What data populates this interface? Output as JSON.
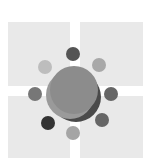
{
  "graphic": {
    "background": "#ffffff",
    "tile_color": "#e9e9e9",
    "tiles": [
      {
        "name": "top-left",
        "x": 8,
        "y": 22,
        "w": 62,
        "h": 64
      },
      {
        "name": "top-right",
        "x": 80,
        "y": 22,
        "w": 63,
        "h": 64
      },
      {
        "name": "bottom-left",
        "x": 8,
        "y": 96,
        "w": 62,
        "h": 62
      },
      {
        "name": "bottom-right",
        "x": 80,
        "y": 96,
        "w": 63,
        "h": 62
      }
    ],
    "center_shapes": [
      {
        "cx": 76,
        "cy": 97,
        "r": 25,
        "color": "#4a4a4a"
      },
      {
        "cx": 70,
        "cy": 95,
        "r": 24,
        "color": "#9a9a9a"
      },
      {
        "cx": 74,
        "cy": 90,
        "r": 24,
        "color": "#8c8c8c"
      }
    ],
    "satellites": [
      {
        "name": "top",
        "cx": 73,
        "cy": 54,
        "r": 7,
        "color": "#555555"
      },
      {
        "name": "top-left",
        "cx": 45,
        "cy": 67,
        "r": 7,
        "color": "#bdbdbd"
      },
      {
        "name": "top-right",
        "cx": 99,
        "cy": 65,
        "r": 7,
        "color": "#a8a8a8"
      },
      {
        "name": "left",
        "cx": 35,
        "cy": 94,
        "r": 7,
        "color": "#777777"
      },
      {
        "name": "right",
        "cx": 111,
        "cy": 94,
        "r": 7,
        "color": "#666666"
      },
      {
        "name": "bottom-left",
        "cx": 48,
        "cy": 123,
        "r": 7,
        "color": "#333333"
      },
      {
        "name": "bottom-right",
        "cx": 102,
        "cy": 120,
        "r": 7,
        "color": "#666666"
      },
      {
        "name": "bottom",
        "cx": 73,
        "cy": 133,
        "r": 7,
        "color": "#a5a5a5"
      }
    ]
  }
}
